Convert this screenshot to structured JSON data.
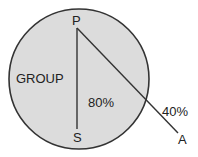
{
  "diagram": {
    "circle_label": "GROUP",
    "points": {
      "top": "P",
      "bottom": "S",
      "outside": "A"
    },
    "edge_labels": {
      "p_to_s": "80%",
      "p_to_a": "40%"
    },
    "colors": {
      "circle_fill": "#dcdcdc",
      "stroke": "#333333"
    }
  }
}
